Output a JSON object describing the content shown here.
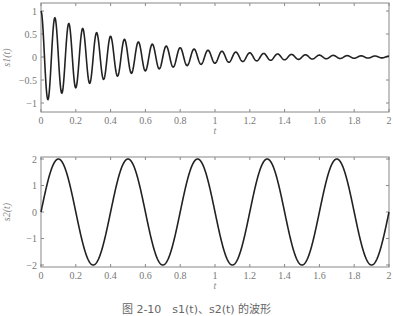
{
  "chart_data": [
    {
      "type": "line",
      "title": "",
      "xlabel": "t",
      "ylabel": "s1(t)",
      "xlim": [
        0,
        2
      ],
      "ylim": [
        -1.15,
        1.2
      ],
      "xticks": [
        "0",
        "0.2",
        "0.4",
        "0.6",
        "0.8",
        "1",
        "1.2",
        "1.4",
        "1.6",
        "1.8",
        "2"
      ],
      "yticks": [
        "-1",
        "-0.5",
        "0",
        "0.5",
        "1"
      ],
      "series": [
        {
          "name": "s1(t)",
          "formula": "exp(-2t)*cos(2*pi*12.5*t)",
          "amplitude": 1,
          "decay": 2,
          "frequency_hz": 12.5
        }
      ],
      "grid": false
    },
    {
      "type": "line",
      "title": "",
      "xlabel": "t",
      "ylabel": "s2(t)",
      "xlim": [
        0,
        2
      ],
      "ylim": [
        -2.1,
        2.1
      ],
      "xticks": [
        "0",
        "0.2",
        "0.4",
        "0.6",
        "0.8",
        "1",
        "1.2",
        "1.4",
        "1.6",
        "1.8",
        "2"
      ],
      "yticks": [
        "-2",
        "-1",
        "0",
        "1",
        "2"
      ],
      "series": [
        {
          "name": "s2(t)",
          "formula": "2*sin(2*pi*2.5*t)",
          "amplitude": 2,
          "frequency_hz": 2.5
        }
      ],
      "grid": false
    }
  ],
  "labels": {
    "top_ylabel": "s1(t)",
    "bottom_ylabel": "s2(t)",
    "xlabel": "t",
    "caption": "图 2-10　s1(t)、s2(t) 的波形"
  }
}
